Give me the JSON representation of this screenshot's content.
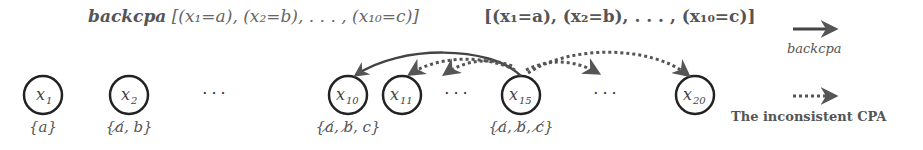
{
  "titles": {
    "left_bold": "backcpa",
    "left_list": "[(x₁=a), (x₂=b), . . . , (x₁₀=c)]",
    "right_list": "[(x₁=a), (x₂=b), . . . , (x₁₀=c)]"
  },
  "nodes": [
    {
      "id": "x1",
      "label": "x",
      "sub": "1",
      "domain": "{a}"
    },
    {
      "id": "x2",
      "label": "x",
      "sub": "2",
      "domain": "{a̸, b}"
    },
    {
      "id": "x10",
      "label": "x",
      "sub": "10",
      "domain": "{a̸, b̸, c}"
    },
    {
      "id": "x11",
      "label": "x",
      "sub": "11"
    },
    {
      "id": "x15",
      "label": "x",
      "sub": "15",
      "domain": "{a̸, b̸, c̸}"
    },
    {
      "id": "x20",
      "label": "x",
      "sub": "20"
    }
  ],
  "ellipsis": "···",
  "edges": [
    {
      "from": "x15",
      "to": "x10",
      "style": "solid",
      "meaning": "backcpa"
    },
    {
      "from": "x15",
      "to": "x11",
      "style": "dotted",
      "meaning": "inconsistent CPA"
    },
    {
      "from": "x15",
      "to": "between x11 and x15",
      "style": "dotted",
      "meaning": "inconsistent CPA"
    },
    {
      "from": "x15",
      "to": "between x15 and x20",
      "style": "dotted",
      "meaning": "inconsistent CPA"
    },
    {
      "from": "x15",
      "to": "x20",
      "style": "dotted",
      "meaning": "inconsistent CPA"
    }
  ],
  "legend": {
    "solid_label": "backcpa",
    "dotted_label": "The inconsistent CPA"
  },
  "colors": {
    "stroke": "#333333",
    "arrow": "#555555",
    "text": "#555555"
  }
}
